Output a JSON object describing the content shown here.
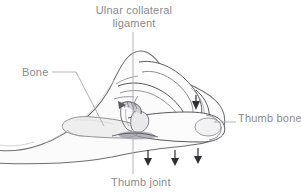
{
  "figure": {
    "type": "anatomical-illustration",
    "background_color": "#ffffff",
    "ink_color": "#4a4a4f",
    "skin_outline_color": "#6e6e73",
    "skin_fill_color": "#fbfbfb",
    "bone_outline_color": "#8d8d92",
    "bone_fill_color": "#eeeeee",
    "shadow_fill_color": "#b9b9be",
    "label_color": "#8a8a8f",
    "leader_color": "#a8a8ad",
    "arrow_color": "#2f2f33"
  },
  "labels": {
    "ulnar_ligament": "Ulnar collateral ligament",
    "ulnar_ligament_line1": "Ulnar collateral",
    "ulnar_ligament_line2": "ligament",
    "bone": "Bone",
    "thumb_bone": "Thumb bone",
    "thumb_joint": "Thumb joint"
  },
  "annotations": {
    "force_arrows_down": 3,
    "force_arrow_finger": 1,
    "arrow_direction": "downward",
    "leader_lines": [
      "ulnar-ligament-vertical",
      "bone-diagonal",
      "thumb-bone-horizontal",
      "thumb-joint-vertical"
    ]
  }
}
